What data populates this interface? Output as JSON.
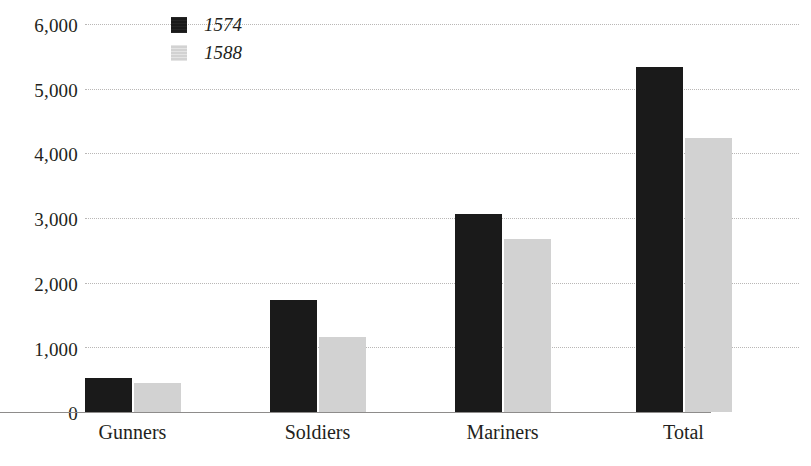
{
  "chart_data": {
    "type": "bar",
    "title": "",
    "subtitle": "",
    "xlabel": "",
    "ylabel": "",
    "categories": [
      "Gunners",
      "Soldiers",
      "Mariners",
      "Total"
    ],
    "series": [
      {
        "name": "1574",
        "color": "#1a1a1a",
        "values": [
          525,
          1730,
          3060,
          5330
        ]
      },
      {
        "name": "1588",
        "color": "#d2d2d2",
        "values": [
          450,
          1160,
          2675,
          4235
        ]
      }
    ],
    "ylim": [
      0,
      6000
    ],
    "ytick_values": [
      6000,
      5000,
      4000,
      3000,
      2000,
      1000,
      0
    ],
    "ytick_labels": [
      "6,000",
      "5,000",
      "4,000",
      "3,000",
      "2,000",
      "1,000",
      "0"
    ],
    "grid": true,
    "grid_style": "dotted-horizontal",
    "legend_position": "top-left-inside",
    "legend_entries": [
      "1574",
      "1588"
    ],
    "annotations": []
  },
  "colors": {
    "series_1574": "#1a1a1a",
    "series_1588": "#d2d2d2",
    "gridline": "#b9b7b6",
    "axis": "#8e8c8b",
    "text": "#231f20",
    "background": "#ffffff"
  }
}
